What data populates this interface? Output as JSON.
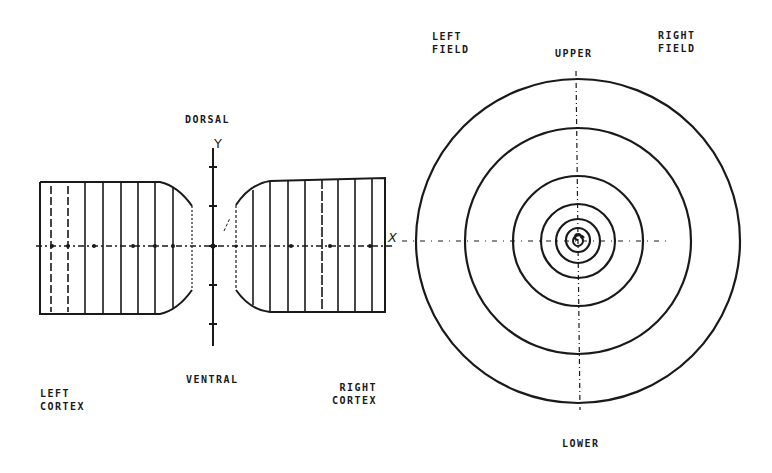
{
  "labels": {
    "dorsal": "DORSAL",
    "ventral": "VENTRAL",
    "left_cortex_1": "LEFT",
    "left_cortex_2": "CORTEX",
    "right_cortex_1": "RIGHT",
    "right_cortex_2": "CORTEX",
    "left_field_1": "LEFT",
    "left_field_2": "FIELD",
    "right_field_1": "RIGHT",
    "right_field_2": "FIELD",
    "upper": "UPPER",
    "lower": "LOWER",
    "y_axis": "Y",
    "x_axis": "X"
  },
  "colors": {
    "ink": "#1a1a1a",
    "background": "#ffffff"
  },
  "cortex_panel": {
    "y_axis_x": 213,
    "x_axis_y": 246,
    "y_ticks": [
      167,
      206,
      246,
      285,
      324
    ],
    "left_cortex_verticals": [
      40,
      51,
      68,
      85,
      103,
      121,
      138,
      155,
      173,
      192
    ],
    "right_cortex_verticals": [
      236,
      253,
      270,
      288,
      305,
      322,
      338,
      355,
      372,
      385
    ]
  },
  "visual_field_panel": {
    "center": [
      578,
      241
    ],
    "ring_radii": [
      162,
      113,
      65,
      37,
      22,
      12,
      5
    ]
  }
}
